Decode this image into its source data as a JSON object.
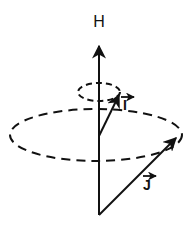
{
  "diagram": {
    "type": "vector precession diagram",
    "colors": {
      "ink": "#111111",
      "background": "#ffffff"
    },
    "axis": {
      "label": "H",
      "from": [
        99,
        215
      ],
      "to": [
        99,
        45
      ],
      "label_pos": [
        99,
        27
      ]
    },
    "small_cone": {
      "ellipse": {
        "cx": 99,
        "cy": 92,
        "rx": 21,
        "ry": 9
      },
      "vector": {
        "label": "I",
        "from": [
          99,
          136
        ],
        "to": [
          120,
          94
        ],
        "label_pos": [
          125,
          108
        ]
      }
    },
    "large_cone": {
      "ellipse": {
        "cx": 96,
        "cy": 135,
        "rx": 86,
        "ry": 26
      },
      "vector": {
        "label": "J",
        "from": [
          99,
          215
        ],
        "to": [
          177,
          137
        ],
        "label_pos": [
          147,
          189
        ]
      }
    }
  }
}
